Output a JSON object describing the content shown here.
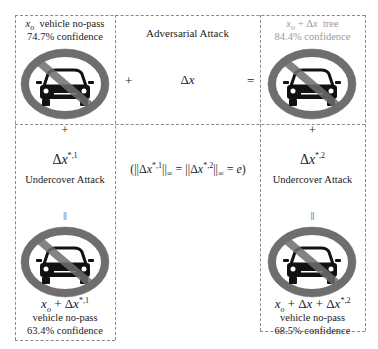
{
  "panels": {
    "original": {
      "label_math": "x_o",
      "label_class": "vehicle no-pass",
      "confidence": "74.7% confidence",
      "image": "no-passing-sign"
    },
    "adversarial": {
      "title": "Adversarial Attack",
      "perturbation": "Δx",
      "plus": "+",
      "equals": "="
    },
    "adversarial_result": {
      "label_math": "x_o + Δx",
      "label_class": "tree",
      "confidence": "84.4% confidence",
      "image": "no-passing-sign"
    },
    "undercover_left": {
      "plus": "+",
      "perturbation": "Δx*,1",
      "title": "Undercover Attack",
      "equals": "||"
    },
    "constraint": "(||Δx*,1||∞ = ||Δx*,2||∞ = e)",
    "undercover_right": {
      "plus": "+",
      "perturbation": "Δx*,2",
      "title": "Undercover Attack",
      "equals": "||"
    },
    "result_left": {
      "label_math": "x_o + Δx*,1",
      "label_class": "vehicle no-pass",
      "confidence": "63.4% confidence",
      "image": "no-passing-sign"
    },
    "result_right": {
      "label_math": "x_o + Δx + Δx*,2",
      "label_class": "vehicle no-pass",
      "confidence": "68.5% confidence",
      "image": "no-passing-sign"
    }
  }
}
